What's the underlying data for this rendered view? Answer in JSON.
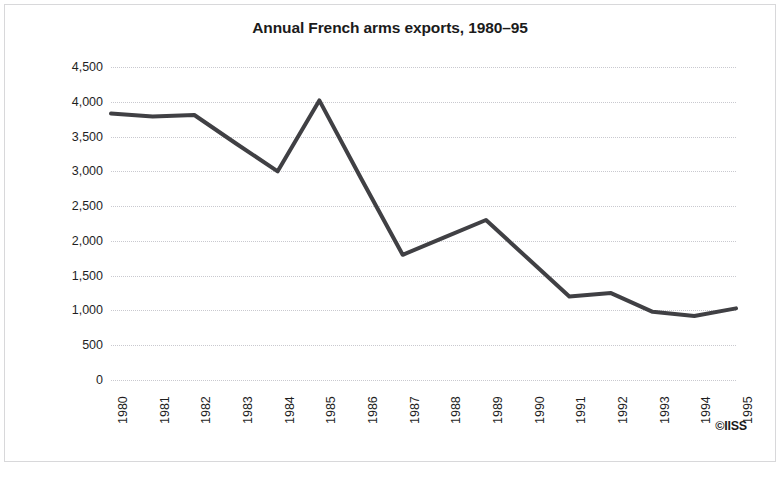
{
  "figure": {
    "credit": "©IISS",
    "border_color": "#d8d8da",
    "background": "#ffffff"
  },
  "chart_data": {
    "type": "line",
    "title": "Annual French arms exports, 1980–95",
    "xlabel": "",
    "ylabel": "Millions of Trend Indicator Values (TIV)",
    "categories": [
      "1980",
      "1981",
      "1982",
      "1983",
      "1984",
      "1985",
      "1986",
      "1987",
      "1988",
      "1989",
      "1990",
      "1991",
      "1992",
      "1993",
      "1994",
      "1995"
    ],
    "values": [
      3830,
      3790,
      3810,
      3400,
      3000,
      4020,
      2900,
      1800,
      2050,
      2300,
      1750,
      1200,
      1250,
      980,
      920,
      1030
    ],
    "ylim": [
      0,
      4500
    ],
    "y_ticks": [
      0,
      500,
      1000,
      1500,
      2000,
      2500,
      3000,
      3500,
      4000,
      4500
    ],
    "y_tick_labels": [
      "0",
      "500",
      "1,000",
      "1,500",
      "2,000",
      "2,500",
      "3,000",
      "3,500",
      "4,000",
      "4,500"
    ],
    "grid": "horizontal-dotted",
    "legend": "none",
    "series_color": "#404044",
    "grid_color": "#c9c9cf",
    "line_width": 4,
    "markers": false
  }
}
